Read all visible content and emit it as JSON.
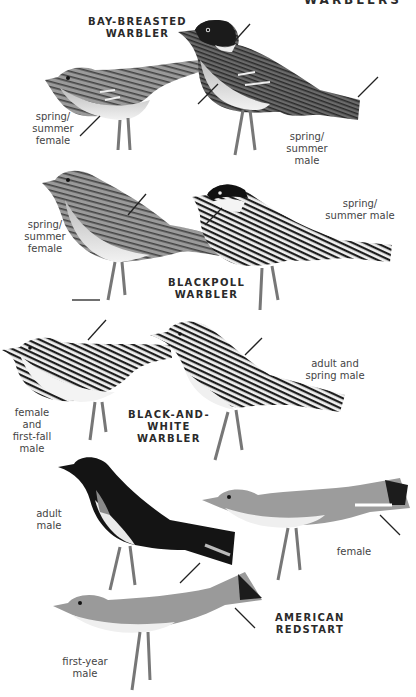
{
  "header": {
    "title": "WARBLERS"
  },
  "species": [
    {
      "name_line1": "BAY-BREASTED",
      "name_line2": "WARBLER",
      "plumages": [
        {
          "label_lines": [
            "spring/",
            "summer",
            "female"
          ]
        },
        {
          "label_lines": [
            "spring/",
            "summer",
            "male"
          ]
        }
      ]
    },
    {
      "name_line1": "BLACKPOLL",
      "name_line2": "WARBLER",
      "plumages": [
        {
          "label_lines": [
            "spring/",
            "summer",
            "female"
          ]
        },
        {
          "label_lines": [
            "spring/",
            "summer male"
          ]
        }
      ]
    },
    {
      "name_line1": "BLACK-AND-",
      "name_line2": "WHITE",
      "name_line3": "WARBLER",
      "plumages": [
        {
          "label_lines": [
            "female and",
            "first-fall",
            "male"
          ]
        },
        {
          "label_lines": [
            "adult and",
            "spring male"
          ]
        }
      ]
    },
    {
      "name_line1": "AMERICAN",
      "name_line2": "REDSTART",
      "plumages": [
        {
          "label_lines": [
            "adult",
            "male"
          ]
        },
        {
          "label_lines": [
            "female"
          ]
        },
        {
          "label_lines": [
            "first-year",
            "male"
          ]
        }
      ]
    }
  ],
  "colors": {
    "ink": "#2a2a2a",
    "label": "#444444",
    "background": "#ffffff"
  }
}
